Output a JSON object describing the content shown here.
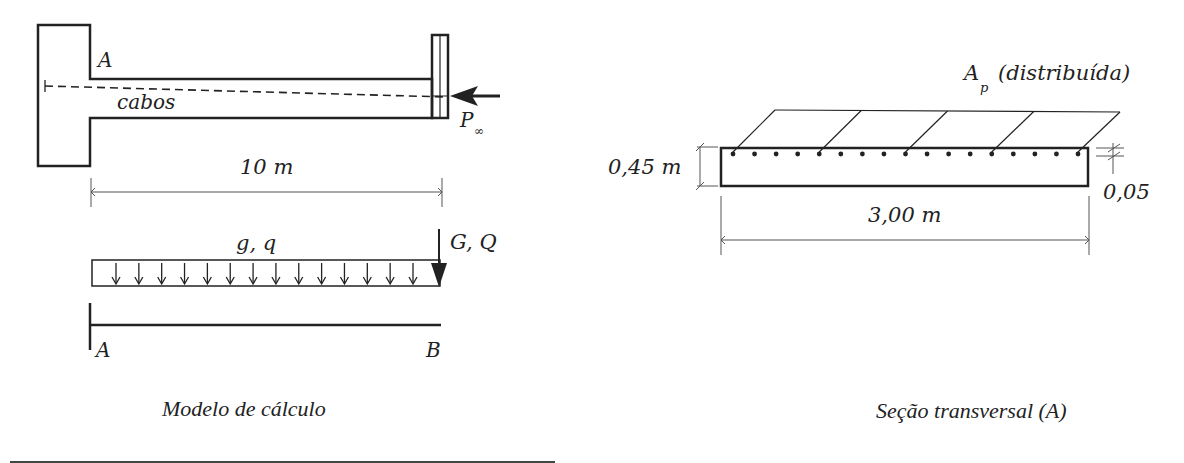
{
  "left_figure": {
    "labels": {
      "point_a_top": "A",
      "cables": "cabos",
      "force_symbol": "P",
      "force_subscript": "∞",
      "span": "10 m",
      "distributed_load": "g, q",
      "point_load": "G, Q",
      "support_a": "A",
      "end_b": "B"
    },
    "caption": "Modelo de cálculo",
    "load_arrow_count": 14
  },
  "right_figure": {
    "labels": {
      "tendon_area_symbol": "A",
      "tendon_area_subscript": "p",
      "tendon_area_note": "(distribuída)",
      "height": "0,45 m",
      "width": "3,00 m",
      "cover": "0,05"
    },
    "caption": "Seção transversal (A)",
    "tendon_dot_count": 17,
    "skew_line_count": 5
  },
  "colors": {
    "ink": "#222222",
    "dim": "#555555",
    "background": "#ffffff"
  }
}
